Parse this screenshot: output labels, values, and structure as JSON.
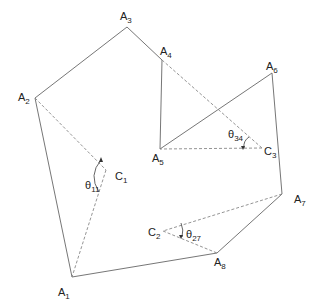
{
  "diagram": {
    "type": "polygon-angle-diagram",
    "colors": {
      "line": "#666666",
      "dashed": "#888888",
      "text": "#222222"
    },
    "points": {
      "A1": {
        "label": "A",
        "sub": "1",
        "x": 72,
        "y": 277,
        "lx": 58,
        "ly": 296
      },
      "A2": {
        "label": "A",
        "sub": "2",
        "x": 35,
        "y": 98,
        "lx": 18,
        "ly": 101
      },
      "A3": {
        "label": "A",
        "sub": "3",
        "x": 127,
        "y": 27,
        "lx": 120,
        "ly": 20
      },
      "A4": {
        "label": "A",
        "sub": "4",
        "x": 162,
        "y": 60,
        "lx": 160,
        "ly": 55
      },
      "A5": {
        "label": "A",
        "sub": "5",
        "x": 160,
        "y": 149,
        "lx": 152,
        "ly": 162
      },
      "A6": {
        "label": "A",
        "sub": "6",
        "x": 272,
        "y": 73,
        "lx": 266,
        "ly": 70
      },
      "A7": {
        "label": "A",
        "sub": "7",
        "x": 282,
        "y": 194,
        "lx": 294,
        "ly": 203
      },
      "A8": {
        "label": "A",
        "sub": "8",
        "x": 217,
        "y": 253,
        "lx": 214,
        "ly": 266
      },
      "C1": {
        "label": "C",
        "sub": "1",
        "x": 106,
        "y": 170,
        "lx": 115,
        "ly": 180
      },
      "C2": {
        "label": "C",
        "sub": "2",
        "x": 163,
        "y": 231,
        "lx": 148,
        "ly": 236
      },
      "C3": {
        "label": "C",
        "sub": "3",
        "x": 262,
        "y": 148,
        "lx": 264,
        "ly": 155
      }
    },
    "solid_edges": [
      [
        "A1",
        "A2"
      ],
      [
        "A2",
        "A3"
      ],
      [
        "A3",
        "A4"
      ],
      [
        "A4",
        "A5"
      ],
      [
        "A5",
        "A6"
      ],
      [
        "A6",
        "A7"
      ],
      [
        "A7",
        "A8"
      ],
      [
        "A8",
        "A1"
      ]
    ],
    "dashed_edges": [
      [
        "A2",
        "C1"
      ],
      [
        "C1",
        "A1"
      ],
      [
        "A4",
        "C3"
      ],
      [
        "C3",
        "A5"
      ],
      [
        "A7",
        "C2"
      ],
      [
        "C2",
        "A8"
      ]
    ],
    "angles": [
      {
        "label": "θ",
        "sub": "11",
        "lx": 85,
        "ly": 189
      },
      {
        "label": "θ",
        "sub": "34",
        "lx": 228,
        "ly": 138
      },
      {
        "label": "θ",
        "sub": "27",
        "lx": 186,
        "ly": 238
      }
    ]
  }
}
